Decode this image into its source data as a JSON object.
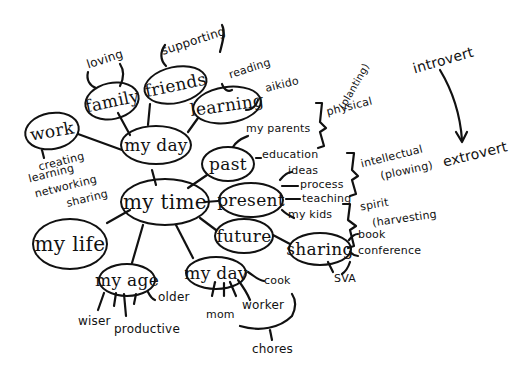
{
  "diagram": {
    "type": "mind-map",
    "style": "hand-drawn ink on white",
    "colors": {
      "ink": "#111111",
      "background": "#ffffff"
    },
    "center": "my time",
    "nodes": {
      "my_time": "my time",
      "my_day_top": "my day",
      "family": "family",
      "friends": "friends",
      "learning": "learning",
      "work": "work",
      "past": "past",
      "present": "present",
      "future": "future",
      "sharing": "sharing",
      "my_life": "my life",
      "my_age": "my age",
      "my_day_bottom": "my day"
    },
    "labels": {
      "loving": "loving",
      "supporting": "supporting",
      "reading": "reading",
      "aikido": "aikido",
      "creating": "creating",
      "learning_sub": "learning",
      "networking": "networking",
      "sharing_sub": "sharing",
      "my_parents": "my parents",
      "education": "education",
      "ideas": "ideas",
      "process": "process",
      "teaching": "teaching",
      "my_kids": "my kids",
      "book": "book",
      "conference": "conference",
      "sva": "SVA",
      "cook": "cook",
      "mom": "mom",
      "worker": "worker",
      "chores": "chores",
      "older": "older",
      "wiser": "wiser",
      "productive": "productive",
      "physical": "physical",
      "planting": "(planting)",
      "intellectual": "intellectual",
      "plowing": "(plowing)",
      "spirit": "spirit",
      "harvesting": "(harvesting",
      "introvert": "introvert",
      "extrovert": "extrovert"
    },
    "edges": [
      [
        "my time",
        "my day"
      ],
      [
        "my time",
        "past"
      ],
      [
        "my time",
        "present"
      ],
      [
        "my time",
        "future"
      ],
      [
        "my time",
        "my life"
      ],
      [
        "my time",
        "my age"
      ],
      [
        "my time",
        "my day (bottom)"
      ],
      [
        "my day",
        "family"
      ],
      [
        "my day",
        "friends"
      ],
      [
        "my day",
        "learning"
      ],
      [
        "my day",
        "work"
      ],
      [
        "future",
        "sharing"
      ]
    ],
    "groupings": [
      {
        "bracket_over": [
          "my parents",
          "education"
        ],
        "label": "physical (planting)"
      },
      {
        "bracket_over": [
          "ideas",
          "process",
          "teaching"
        ],
        "label": "intellectual (plowing)"
      },
      {
        "bracket_over": [
          "my kids",
          "book",
          "conference"
        ],
        "label": "spirit (harvesting"
      }
    ],
    "arrow": {
      "from": "introvert",
      "to": "extrovert"
    }
  }
}
